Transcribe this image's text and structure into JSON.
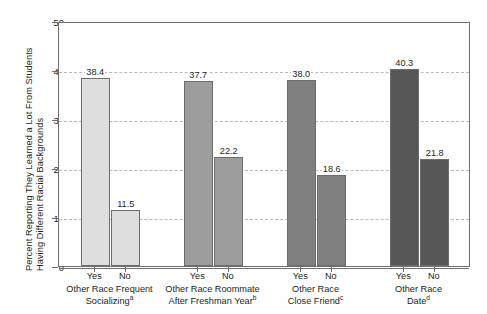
{
  "chart_data": {
    "type": "bar",
    "title": "",
    "subtitle": "",
    "xlabel": "",
    "ylabel": "Percent Reporting They Learned a Lot From Students Having Different Racial Backgrounds",
    "ylabel_lines": [
      "Percent Reporting They Learned a Lot From Students",
      "Having Different Racial Backgrounds"
    ],
    "ylim": [
      0,
      50
    ],
    "yticks": [
      0,
      10,
      20,
      30,
      40,
      50
    ],
    "ytick_labels": [
      "0",
      "10",
      "20",
      "30",
      "40",
      "50"
    ],
    "grid": true,
    "grid_style": "dashed-horizontal",
    "legend": "none",
    "categories": [
      "Yes",
      "No"
    ],
    "groups": [
      {
        "name": "Other Race Frequent Socializing",
        "label_lines": [
          "Other Race Frequent",
          "Socializing"
        ],
        "footnote": "a",
        "color": "#dedede",
        "bars": [
          {
            "category": "Yes",
            "value": 38.4,
            "value_label": "38.4"
          },
          {
            "category": "No",
            "value": 11.5,
            "value_label": "11.5"
          }
        ]
      },
      {
        "name": "Other Race Roommate After Freshman Year",
        "label_lines": [
          "Other Race Roommate",
          "After Freshman Year"
        ],
        "footnote": "b",
        "color": "#9d9d9d",
        "bars": [
          {
            "category": "Yes",
            "value": 37.7,
            "value_label": "37.7"
          },
          {
            "category": "No",
            "value": 22.2,
            "value_label": "22.2"
          }
        ]
      },
      {
        "name": "Other Race Close Friend",
        "label_lines": [
          "Other Race",
          "Close Friend"
        ],
        "footnote": "c",
        "color": "#808080",
        "bars": [
          {
            "category": "Yes",
            "value": 38.0,
            "value_label": "38.0"
          },
          {
            "category": "No",
            "value": 18.6,
            "value_label": "18.6"
          }
        ]
      },
      {
        "name": "Other Race Date",
        "label_lines": [
          "Other Race",
          "Date"
        ],
        "footnote": "d",
        "color": "#575757",
        "bars": [
          {
            "category": "Yes",
            "value": 40.3,
            "value_label": "40.3"
          },
          {
            "category": "No",
            "value": 21.8,
            "value_label": "21.8"
          }
        ]
      }
    ],
    "colors": {
      "axis": "#6f6f6f",
      "grid": "#b9b9b9",
      "text": "#231f20",
      "background": "#ffffff",
      "bar_border": "#6d6d6d"
    }
  }
}
